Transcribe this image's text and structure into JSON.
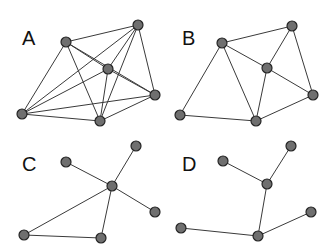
{
  "figure": {
    "width": 331,
    "height": 252,
    "background_color": "#ffffff",
    "node_fill_color": "#6f6f6f",
    "node_stroke_color": "#242424",
    "edge_color": "#3a3a3a",
    "label_color": "#111111",
    "node_radius": 5
  },
  "panels": [
    {
      "id": "A",
      "label": "A",
      "label_position": {
        "x": 22,
        "y": 45
      },
      "description": "dense graph, six nodes, nearly complete",
      "node_count": 6,
      "edge_count": 13,
      "nodes": [
        {
          "id": "a0",
          "x": 66,
          "y": 42
        },
        {
          "id": "a1",
          "x": 138,
          "y": 25
        },
        {
          "id": "a2",
          "x": 108,
          "y": 69
        },
        {
          "id": "a3",
          "x": 155,
          "y": 95
        },
        {
          "id": "a4",
          "x": 22,
          "y": 114
        },
        {
          "id": "a5",
          "x": 100,
          "y": 121
        }
      ],
      "edges": [
        [
          "a0",
          "a1"
        ],
        [
          "a0",
          "a2"
        ],
        [
          "a0",
          "a3"
        ],
        [
          "a0",
          "a4"
        ],
        [
          "a0",
          "a5"
        ],
        [
          "a1",
          "a2"
        ],
        [
          "a1",
          "a3"
        ],
        [
          "a1",
          "a4"
        ],
        [
          "a1",
          "a5"
        ],
        [
          "a2",
          "a3"
        ],
        [
          "a2",
          "a4"
        ],
        [
          "a2",
          "a5"
        ],
        [
          "a3",
          "a4"
        ],
        [
          "a3",
          "a5"
        ],
        [
          "a4",
          "a5"
        ]
      ]
    },
    {
      "id": "B",
      "label": "B",
      "label_position": {
        "x": 182,
        "y": 45
      },
      "description": "planar triangulated graph, six nodes",
      "node_count": 6,
      "edge_count": 9,
      "nodes": [
        {
          "id": "b0",
          "x": 222,
          "y": 43
        },
        {
          "id": "b1",
          "x": 292,
          "y": 26
        },
        {
          "id": "b2",
          "x": 267,
          "y": 68
        },
        {
          "id": "b3",
          "x": 313,
          "y": 95
        },
        {
          "id": "b4",
          "x": 180,
          "y": 115
        },
        {
          "id": "b5",
          "x": 256,
          "y": 121
        }
      ],
      "edges": [
        [
          "b0",
          "b1"
        ],
        [
          "b0",
          "b2"
        ],
        [
          "b0",
          "b4"
        ],
        [
          "b0",
          "b5"
        ],
        [
          "b1",
          "b2"
        ],
        [
          "b1",
          "b3"
        ],
        [
          "b2",
          "b3"
        ],
        [
          "b2",
          "b5"
        ],
        [
          "b3",
          "b5"
        ],
        [
          "b4",
          "b5"
        ]
      ]
    },
    {
      "id": "C",
      "label": "C",
      "label_position": {
        "x": 22,
        "y": 171
      },
      "description": "star hub with one triangle cycle, six nodes",
      "node_count": 6,
      "edge_count": 6,
      "nodes": [
        {
          "id": "c0",
          "x": 66,
          "y": 162
        },
        {
          "id": "c1",
          "x": 136,
          "y": 146
        },
        {
          "id": "c2",
          "x": 112,
          "y": 186
        },
        {
          "id": "c3",
          "x": 155,
          "y": 212
        },
        {
          "id": "c4",
          "x": 24,
          "y": 235
        },
        {
          "id": "c5",
          "x": 101,
          "y": 238
        }
      ],
      "edges": [
        [
          "c0",
          "c2"
        ],
        [
          "c1",
          "c2"
        ],
        [
          "c2",
          "c3"
        ],
        [
          "c2",
          "c4"
        ],
        [
          "c2",
          "c5"
        ],
        [
          "c4",
          "c5"
        ]
      ]
    },
    {
      "id": "D",
      "label": "D",
      "label_position": {
        "x": 182,
        "y": 171
      },
      "description": "tree, six nodes, five edges",
      "node_count": 6,
      "edge_count": 5,
      "nodes": [
        {
          "id": "d0",
          "x": 223,
          "y": 161
        },
        {
          "id": "d1",
          "x": 291,
          "y": 146
        },
        {
          "id": "d2",
          "x": 267,
          "y": 184
        },
        {
          "id": "d3",
          "x": 311,
          "y": 212
        },
        {
          "id": "d4",
          "x": 181,
          "y": 228
        },
        {
          "id": "d5",
          "x": 258,
          "y": 236
        }
      ],
      "edges": [
        [
          "d0",
          "d2"
        ],
        [
          "d1",
          "d2"
        ],
        [
          "d2",
          "d5"
        ],
        [
          "d3",
          "d5"
        ],
        [
          "d4",
          "d5"
        ]
      ]
    }
  ]
}
